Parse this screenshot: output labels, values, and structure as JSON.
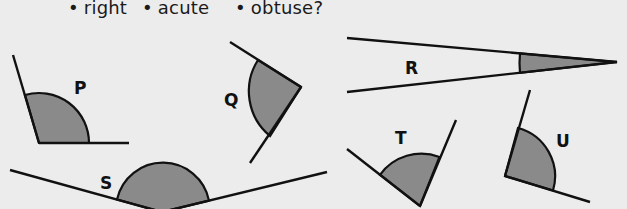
{
  "question": {
    "options": [
      {
        "bullet": "•",
        "label": "right"
      },
      {
        "bullet": "•",
        "label": "acute"
      },
      {
        "bullet": "•",
        "label": "obtuse?"
      }
    ]
  },
  "colors": {
    "background": "#ececec",
    "line": "#111111",
    "shade": "#8a8a8a"
  },
  "angles": [
    {
      "id": "P",
      "label": "P",
      "type_shown": "obtuse"
    },
    {
      "id": "Q",
      "label": "Q",
      "type_shown": "acute"
    },
    {
      "id": "R",
      "label": "R",
      "type_shown": "acute"
    },
    {
      "id": "S",
      "label": "S",
      "type_shown": "obtuse"
    },
    {
      "id": "T",
      "label": "T",
      "type_shown": "acute"
    },
    {
      "id": "U",
      "label": "U",
      "type_shown": "obtuse"
    }
  ]
}
